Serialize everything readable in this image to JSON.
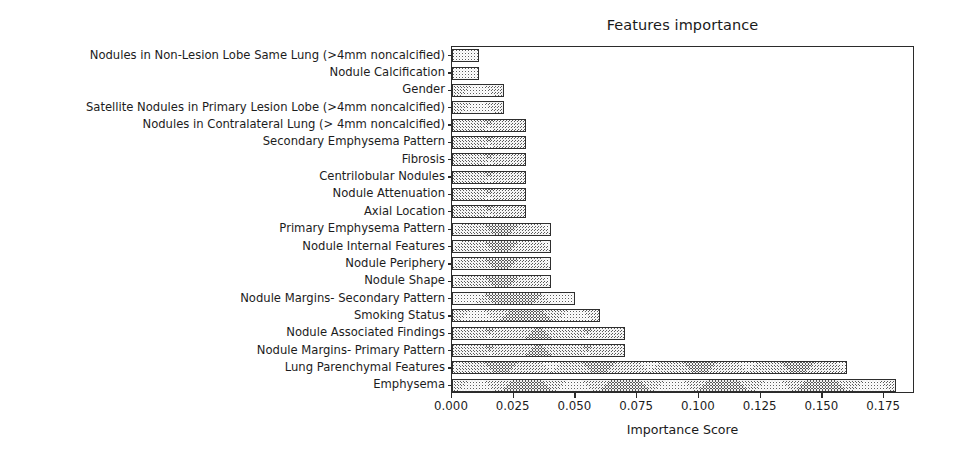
{
  "figure": {
    "background_color": "#ffffff",
    "width": 953,
    "height": 460
  },
  "chart_data": {
    "type": "bar",
    "orientation": "horizontal",
    "title": "Features importance",
    "xlabel": "Importance Score",
    "ylabel": "",
    "xlim": [
      0.0,
      0.1875
    ],
    "xticks": [
      0.0,
      0.025,
      0.05,
      0.075,
      0.1,
      0.125,
      0.15,
      0.175
    ],
    "xtick_labels": [
      "0.000",
      "0.025",
      "0.050",
      "0.075",
      "0.100",
      "0.125",
      "0.150",
      "0.175"
    ],
    "grid": false,
    "legend": null,
    "bar_color": "#5a5a5a",
    "bar_hatch": "cross-hatch",
    "bar_edge_color": "#2e2e2e",
    "categories": [
      "Nodules in Non-Lesion Lobe Same Lung (>4mm noncalcified)",
      "Nodule Calcification",
      "Gender",
      "Satellite Nodules in Primary Lesion Lobe (>4mm noncalcified)",
      "Nodules in Contralateral Lung (> 4mm noncalcified)",
      "Secondary Emphysema Pattern",
      "Fibrosis",
      "Centrilobular Nodules",
      "Nodule Attenuation",
      "Axial Location",
      "Primary Emphysema Pattern",
      "Nodule Internal Features",
      "Nodule Periphery",
      "Nodule Shape",
      "Nodule Margins- Secondary Pattern",
      "Smoking Status",
      "Nodule Associated Findings",
      "Nodule Margins- Primary Pattern",
      "Lung Parenchymal Features",
      "Emphysema"
    ],
    "values": [
      0.011,
      0.011,
      0.021,
      0.021,
      0.03,
      0.03,
      0.03,
      0.03,
      0.03,
      0.03,
      0.04,
      0.04,
      0.04,
      0.04,
      0.05,
      0.06,
      0.07,
      0.07,
      0.16,
      0.18
    ]
  }
}
